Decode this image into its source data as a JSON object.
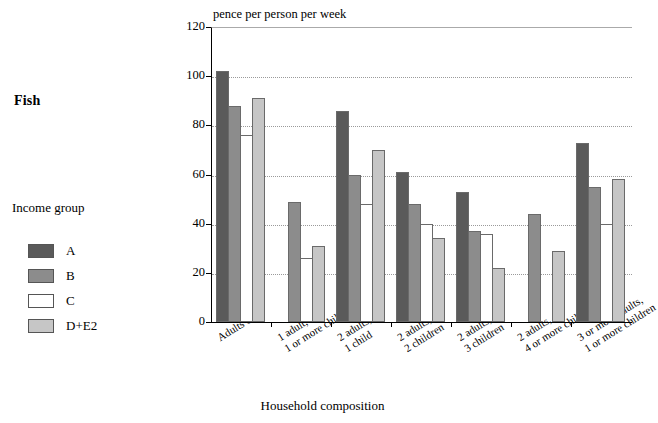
{
  "food_label": "Fish",
  "legend": {
    "title": "Income group",
    "items": [
      {
        "label": "A",
        "color": "#5a5a5a"
      },
      {
        "label": "B",
        "color": "#8c8c8c"
      },
      {
        "label": "C",
        "color": "#ffffff"
      },
      {
        "label": "D+E2",
        "color": "#c6c6c6"
      }
    ]
  },
  "chart_data": {
    "type": "bar",
    "title": "Fish",
    "unit_label": "pence per person per week",
    "xlabel": "Household composition",
    "ylabel": "",
    "ylim": [
      0,
      120
    ],
    "yticks": [
      0,
      20,
      40,
      60,
      80,
      100,
      120
    ],
    "grid": true,
    "legend_position": "left",
    "legend_title": "Income group",
    "categories": [
      "Adults only",
      "1 adult, 1 or more children",
      "2 adults, 1 child",
      "2 adults, 2 children",
      "2 adults, 3 children",
      "2 adults, 4 or more children",
      "3 or more adults, 1 or more children"
    ],
    "category_lines": [
      [
        "Adults only"
      ],
      [
        "1 adult,",
        "1 or more children"
      ],
      [
        "2 adults,",
        "1 child"
      ],
      [
        "2 adults,",
        "2 children"
      ],
      [
        "2 adults,",
        "3 children"
      ],
      [
        "2 adults,",
        "4 or more children"
      ],
      [
        "3 or more adults,",
        "1 or more children"
      ]
    ],
    "series": [
      {
        "name": "A",
        "color": "#5a5a5a",
        "values": [
          102,
          null,
          86,
          61,
          53,
          null,
          73
        ]
      },
      {
        "name": "B",
        "color": "#8c8c8c",
        "values": [
          88,
          49,
          60,
          48,
          37,
          44,
          55
        ]
      },
      {
        "name": "C",
        "color": "#ffffff",
        "values": [
          76,
          26,
          48,
          40,
          36,
          null,
          40
        ]
      },
      {
        "name": "D+E2",
        "color": "#c6c6c6",
        "values": [
          91,
          31,
          70,
          34,
          22,
          29,
          58
        ]
      }
    ]
  }
}
